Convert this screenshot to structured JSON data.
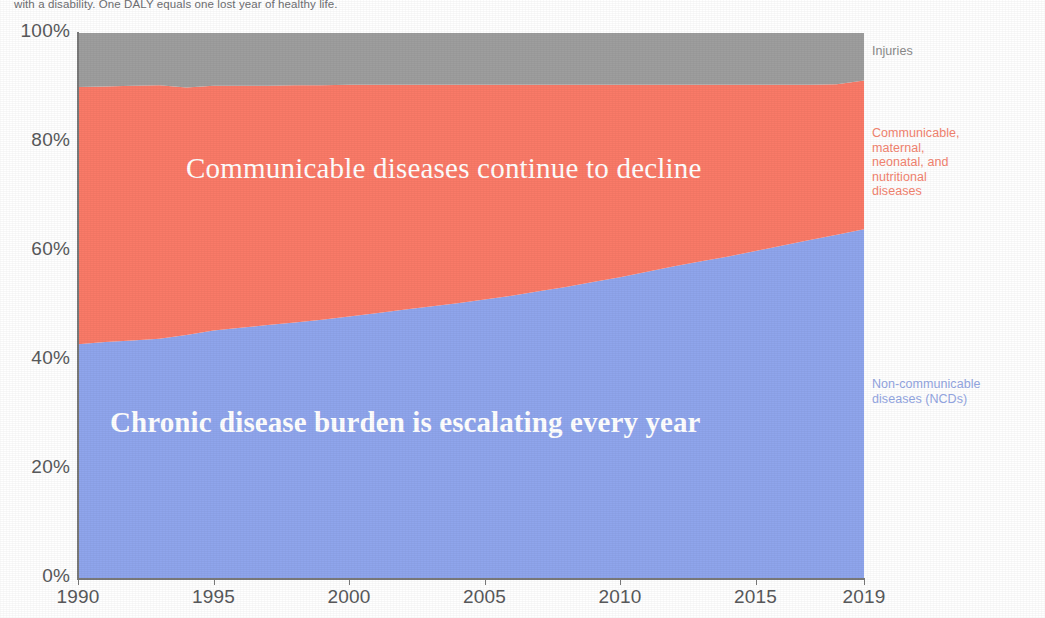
{
  "caption": "with a disability. One DALY equals one lost year of healthy life.",
  "series_labels": {
    "injuries": "Injuries",
    "communicable": "Communicable,\nmaternal,\nneonatal, and\nnutritional\ndiseases",
    "ncd": "Non-communicable\ndiseases (NCDs)"
  },
  "annotations": {
    "communicable": "Communicable diseases continue to decline",
    "ncd": "Chronic disease burden is escalating every year"
  },
  "colors": {
    "ncd": "#8fa5ec",
    "communicable": "#fa7a68",
    "injuries": "#9e9e9e",
    "axis": "#7a7a7a",
    "tick_text": "#58595b",
    "caption_text": "#6d6e71",
    "annotation_text": "#ffffff",
    "label_injuries": "#8a8a8a",
    "label_communicable": "#f3836f",
    "label_ncd": "#93a6e2"
  },
  "chart_data": {
    "type": "area",
    "title": "",
    "subtitle": "",
    "xlabel": "",
    "ylabel": "",
    "stacked": true,
    "normalized_percent": true,
    "grid": false,
    "legend_position": "right",
    "xlim": [
      1990,
      2019
    ],
    "ylim": [
      0,
      100
    ],
    "ytick_labels": [
      "0%",
      "20%",
      "40%",
      "60%",
      "80%",
      "100%"
    ],
    "ytick_values": [
      0,
      20,
      40,
      60,
      80,
      100
    ],
    "xtick_labels": [
      "1990",
      "1995",
      "2000",
      "2005",
      "2010",
      "2015",
      "2019"
    ],
    "xtick_values": [
      1990,
      1995,
      2000,
      2005,
      2010,
      2015,
      2019
    ],
    "x": [
      1990,
      1991,
      1992,
      1993,
      1994,
      1995,
      1996,
      1997,
      1998,
      1999,
      2000,
      2001,
      2002,
      2003,
      2004,
      2005,
      2006,
      2007,
      2008,
      2009,
      2010,
      2011,
      2012,
      2013,
      2014,
      2015,
      2016,
      2017,
      2018,
      2019
    ],
    "series": [
      {
        "name": "Non-communicable diseases (NCDs)",
        "color": "#8fa5ec",
        "values": [
          42.9,
          43.3,
          43.6,
          43.9,
          44.6,
          45.4,
          45.9,
          46.4,
          46.9,
          47.4,
          48.0,
          48.6,
          49.2,
          49.8,
          50.4,
          51.1,
          51.8,
          52.6,
          53.4,
          54.3,
          55.2,
          56.2,
          57.2,
          58.1,
          59.0,
          60.0,
          61.0,
          62.0,
          63.0,
          64.0
        ]
      },
      {
        "name": "Communicable, maternal, neonatal, and nutritional diseases",
        "color": "#fa7a68",
        "values": [
          47.2,
          46.9,
          46.7,
          46.5,
          45.4,
          44.9,
          44.4,
          43.9,
          43.5,
          43.0,
          42.5,
          41.9,
          41.3,
          40.7,
          40.1,
          39.4,
          38.7,
          37.9,
          37.1,
          36.2,
          35.3,
          34.3,
          33.3,
          32.4,
          31.5,
          30.5,
          29.5,
          28.5,
          27.6,
          27.3
        ]
      },
      {
        "name": "Injuries",
        "color": "#9e9e9e",
        "values": [
          9.9,
          9.8,
          9.7,
          9.6,
          10.0,
          9.7,
          9.7,
          9.7,
          9.6,
          9.6,
          9.5,
          9.5,
          9.5,
          9.5,
          9.5,
          9.5,
          9.5,
          9.5,
          9.5,
          9.5,
          9.5,
          9.5,
          9.5,
          9.5,
          9.5,
          9.5,
          9.5,
          9.5,
          9.4,
          8.7
        ]
      }
    ],
    "annotations": [
      {
        "text": "Communicable diseases continue to decline",
        "series": "Communicable, maternal, neonatal, and nutritional diseases"
      },
      {
        "text": "Chronic disease burden is escalating every year",
        "series": "Non-communicable diseases (NCDs)"
      }
    ]
  }
}
